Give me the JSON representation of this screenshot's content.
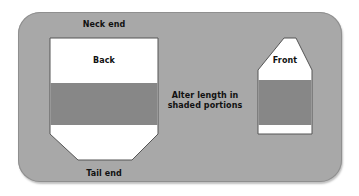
{
  "labels": {
    "neck_end": "Neck end",
    "tail_end": "Tail end",
    "back": "Back",
    "front": "Front",
    "instruction_line1": "Alter length in",
    "instruction_line2": "shaded portions"
  },
  "colors": {
    "background": "#a8a8a8",
    "shaded": "#878787",
    "piece": "#ffffff",
    "outline": "#555555"
  }
}
